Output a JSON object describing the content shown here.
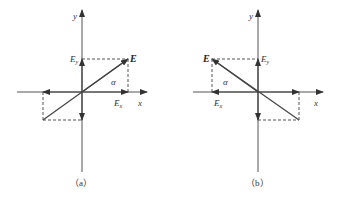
{
  "figure": {
    "panels": [
      {
        "id": "a",
        "caption": "（a）",
        "labels": {
          "y_axis": "y",
          "x_axis": "x",
          "vector": "E",
          "component_y": "E",
          "component_y_sub": "y",
          "component_x": "E",
          "component_x_sub": "x",
          "angle": "α"
        },
        "vector_direction": "up-right"
      },
      {
        "id": "b",
        "caption": "（b）",
        "labels": {
          "y_axis": "y",
          "x_axis": "x",
          "vector": "E",
          "component_y": "E",
          "component_y_sub": "y",
          "component_x": "E",
          "component_x_sub": "x",
          "angle": "α"
        },
        "vector_direction": "up-left"
      }
    ],
    "colors": {
      "line": "#4a4a4a",
      "text": "#333333",
      "background": "#ffffff"
    }
  }
}
